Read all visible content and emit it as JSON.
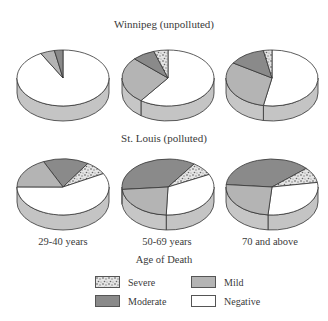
{
  "chart_data": {
    "type": "pie",
    "style": "3d",
    "xlabel": "Age of Death",
    "categories": [
      "29-40 years",
      "50-69 years",
      "70 and above"
    ],
    "legend": [
      {
        "name": "Severe",
        "color": "#d8d8d8",
        "pattern": "speckle"
      },
      {
        "name": "Mild",
        "color": "#b4b4b4"
      },
      {
        "name": "Moderate",
        "color": "#8a8a8a"
      },
      {
        "name": "Negative",
        "color": "#ffffff"
      }
    ],
    "groups": [
      {
        "title": "Winnipeg (unpolluted)",
        "pies": [
          {
            "category": "29-40 years",
            "Severe": 0,
            "Mild": 5,
            "Moderate": 3,
            "Negative": 92
          },
          {
            "category": "50-69 years",
            "Severe": 5,
            "Mild": 27,
            "Moderate": 8,
            "Negative": 60
          },
          {
            "category": "70 and above",
            "Severe": 3,
            "Mild": 31,
            "Moderate": 13,
            "Negative": 53
          }
        ]
      },
      {
        "title": "St. Louis (polluted)",
        "pies": [
          {
            "category": "29-40 years",
            "Severe": 8,
            "Mild": 18,
            "Moderate": 16,
            "Negative": 58
          },
          {
            "category": "50-69 years",
            "Severe": 8,
            "Mild": 23,
            "Moderate": 36,
            "Negative": 33
          },
          {
            "category": "70 and above",
            "Severe": 9,
            "Mild": 25,
            "Moderate": 37,
            "Negative": 29
          }
        ]
      }
    ]
  },
  "titles": {
    "top": "Winnipeg (unpolluted)",
    "bottom": "St. Louis (polluted)"
  },
  "categories": [
    "29-40 years",
    "50-69 years",
    "70 and above"
  ],
  "xlabel": "Age of Death",
  "legend": {
    "severe": "Severe",
    "mild": "Mild",
    "moderate": "Moderate",
    "negative": "Negative"
  }
}
